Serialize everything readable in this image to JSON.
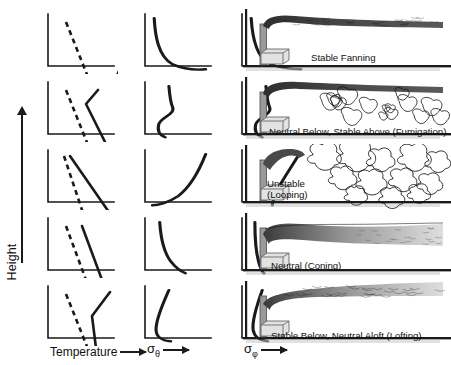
{
  "figure": {
    "type": "atmospheric-stability-plume-dispersion-diagram",
    "axes": {
      "y_label": "Height",
      "y_arrow": "up",
      "x_labels": [
        {
          "text": "Temperature",
          "arrow": "right",
          "column": 1
        },
        {
          "text": "σ",
          "subscript": "θ",
          "arrow": "right",
          "column": 2
        },
        {
          "text": "σ",
          "subscript": "φ",
          "arrow": "right",
          "column": 3
        }
      ]
    },
    "colors": {
      "ink": "#1a1a1a",
      "axis": "#1a1a1a",
      "plume_dark": "#3a3a3a",
      "plume_light": "#d8d8d8",
      "ground": "#c9c9c9",
      "stack": "#9a9a9a",
      "building": "#e2e2e2"
    },
    "legend_lines": {
      "dashed": "dry adiabatic lapse rate",
      "solid": "environmental temperature profile"
    },
    "rows": [
      {
        "id": "fanning",
        "caption": "Stable Fanning",
        "caption_lines": [
          "Stable Fanning"
        ],
        "stability": "stable",
        "temperature": {
          "dashed": [
            [
              18,
              8
            ],
            [
              46,
              78
            ]
          ],
          "solid": [
            [
              62,
              78
            ],
            [
              92,
              8
            ]
          ],
          "description": "strong inversion: environmental profile slopes right with height"
        },
        "sigma_theta": {
          "path": "M 10 6 C 11 30, 14 60, 30 72 C 44 80, 58 80, 66 79",
          "description": "very small near-zero aloft, increasing sharply near surface"
        },
        "sigma_phi": {
          "path": "M 10 6 C 11 28, 14 58, 28 70 C 42 78, 56 79, 64 79",
          "description": "small throughout, rises only near surface"
        },
        "plume": "narrow flat ribbon fanning horizontally"
      },
      {
        "id": "fumigation",
        "caption": "Neutral Below, Stable Above (Fumigation)",
        "caption_lines": [
          "Neutral Below, Stable Above (Fumigation)"
        ],
        "stability": "neutral below, stable above",
        "temperature": {
          "dashed": [
            [
              18,
              8
            ],
            [
              46,
              78
            ]
          ],
          "solid": [
            [
              50,
              8
            ],
            [
              38,
              22
            ],
            [
              66,
              78
            ]
          ],
          "description": "kinked profile: stable layer above, neutral below"
        },
        "sigma_theta": {
          "path": "M 26 6 C 27 22, 28 30, 30 36 C 33 46, 18 50, 15 60 C 13 70, 16 76, 22 79",
          "description": "step decrease across inversion base"
        },
        "sigma_phi": {
          "path": "M 26 6 C 27 22, 28 30, 30 36 C 33 46, 18 50, 15 60 C 13 70, 16 76, 22 79",
          "description": "step decrease across inversion base"
        },
        "plume": "plume trapped under inversion then fumigating downward in eddies"
      },
      {
        "id": "looping",
        "caption": "Unstable (Looping)",
        "caption_lines": [
          "Unstable",
          "(Looping)"
        ],
        "stability": "unstable",
        "temperature": {
          "dashed": [
            [
              16,
              6
            ],
            [
              40,
              78
            ]
          ],
          "solid": [
            [
              22,
              6
            ],
            [
              72,
              78
            ]
          ],
          "description": "superadiabatic: environmental profile steeper (to right of) dry adiabat"
        },
        "sigma_theta": {
          "path": "M 66 6 C 60 26, 50 52, 36 66 C 26 75, 14 79, 8 79",
          "description": "large values, increasing with height"
        },
        "sigma_phi": {
          "path": "M 62 6 C 55 22, 44 42, 38 58 C 34 70, 33 76, 33 79",
          "description": "large and increasing with height"
        },
        "plume": "large looping convective eddies carrying plume up and down"
      },
      {
        "id": "coning",
        "caption": "Neutral (Coning)",
        "caption_lines": [
          "Neutral (Coning)"
        ],
        "stability": "neutral",
        "temperature": {
          "dashed": [
            [
              18,
              8
            ],
            [
              44,
              78
            ]
          ],
          "solid": [
            [
              34,
              8
            ],
            [
              60,
              78
            ]
          ],
          "description": "environmental profile parallel to dry adiabat"
        },
        "sigma_theta": {
          "path": "M 16 6 C 17 26, 20 48, 28 62 C 34 72, 40 77, 44 79",
          "description": "moderate, slowly increasing toward surface"
        },
        "sigma_phi": {
          "path": "M 14 6 C 14 26, 15 48, 18 62 C 20 72, 22 77, 24 79",
          "description": "moderate and nearly constant with height"
        },
        "plume": "symmetric cone-shaped plume spreading with distance"
      },
      {
        "id": "lofting",
        "caption": "Stable Below, Neutral Aloft (Lofting)",
        "caption_lines": [
          "Stable Below, Neutral Aloft (Lofting)"
        ],
        "stability": "stable below, neutral aloft",
        "temperature": {
          "dashed": [
            [
              18,
              8
            ],
            [
              46,
              78
            ]
          ],
          "solid": [
            [
              62,
              6
            ],
            [
              44,
              30
            ],
            [
              50,
              78
            ]
          ],
          "description": "V shape: surface inversion below, neutral layer aloft"
        },
        "sigma_theta": {
          "path": "M 26 6 C 20 24, 12 46, 12 62 C 12 72, 18 78, 28 79",
          "description": "larger aloft, decreasing into stable surface layer"
        },
        "sigma_phi": {
          "path": "M 22 6 C 17 24, 11 46, 12 62 C 13 72, 19 78, 28 79",
          "description": "larger aloft, suppressed in stable surface layer"
        },
        "plume": "plume lofting upward above the surface inversion"
      }
    ]
  }
}
